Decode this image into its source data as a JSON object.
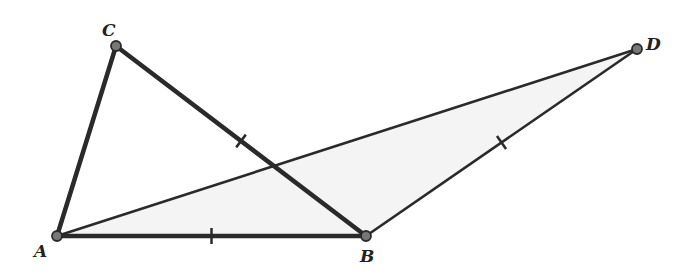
{
  "diagram": {
    "type": "geometry",
    "background": "#ffffff",
    "stroke_color": "#2a2a2a",
    "point_fill": "#777777",
    "points": {
      "A": {
        "label": "A",
        "x": 57,
        "y": 236,
        "lx": 34,
        "ly": 257
      },
      "B": {
        "label": "B",
        "x": 366,
        "y": 236,
        "lx": 360,
        "ly": 262
      },
      "C": {
        "label": "C",
        "x": 116,
        "y": 46,
        "lx": 102,
        "ly": 36
      },
      "D": {
        "label": "D",
        "x": 637,
        "y": 49,
        "lx": 646,
        "ly": 50
      }
    },
    "segments": [
      {
        "name": "segment-ac",
        "from": "A",
        "to": "C",
        "width": 4.5
      },
      {
        "name": "segment-cb",
        "from": "C",
        "to": "B",
        "width": 4.5,
        "tick": true
      },
      {
        "name": "segment-ab",
        "from": "A",
        "to": "B",
        "width": 4.5,
        "tick": true
      },
      {
        "name": "segment-ad",
        "from": "A",
        "to": "D",
        "width": 2.6
      },
      {
        "name": "segment-bd",
        "from": "B",
        "to": "D",
        "width": 2.6,
        "tick": true
      }
    ],
    "equal_marks_note": "CB = AB = BD"
  }
}
